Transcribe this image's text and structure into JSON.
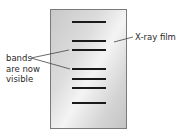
{
  "diagram": {
    "film_label": "X-ray film",
    "bands_label": [
      "bands",
      "are now",
      "visible"
    ],
    "band_positions_y": [
      22,
      41,
      50,
      69,
      79,
      88,
      103
    ],
    "band_count": 7
  }
}
